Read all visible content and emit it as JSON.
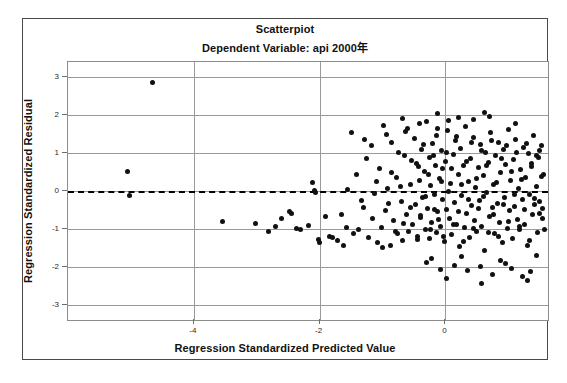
{
  "chart_data": {
    "type": "scatter",
    "title": "Scatterpiot",
    "subtitle": "Dependent Variable: api 2000年",
    "xlabel": "Regression Standardized Predicted Value",
    "ylabel": "Regression Standardized Residual",
    "xlim": [
      -6.0,
      1.63
    ],
    "ylim": [
      -3.38,
      3.38
    ],
    "xticks": [
      -4,
      -2,
      0
    ],
    "yticks": [
      3,
      2,
      1,
      0,
      -1,
      -2,
      -3
    ],
    "xtick_labels": [
      "-4",
      "-2",
      "0"
    ],
    "ytick_labels": [
      "3",
      "2",
      "1",
      "0",
      "-1",
      "-2",
      "-3"
    ],
    "grid": true,
    "legend": "none",
    "reference_line": {
      "axis": "y",
      "value": 0,
      "style": "dashed",
      "color": "#000000"
    },
    "marker": {
      "shape": "circle",
      "color": "#111111",
      "size": 5
    },
    "points": [
      [
        -4.65,
        2.85
      ],
      [
        -5.05,
        0.5
      ],
      [
        -5.03,
        -0.12
      ],
      [
        -3.55,
        -0.8
      ],
      [
        -3.02,
        -0.85
      ],
      [
        -2.82,
        -1.05
      ],
      [
        -2.6,
        -0.72
      ],
      [
        -2.48,
        -0.55
      ],
      [
        -2.44,
        -0.58
      ],
      [
        -2.18,
        -0.9
      ],
      [
        -2.12,
        0.22
      ],
      [
        -2.08,
        0.02
      ],
      [
        -2.06,
        -0.05
      ],
      [
        -2.02,
        -1.28
      ],
      [
        -2.0,
        -1.35
      ],
      [
        -1.9,
        -0.68
      ],
      [
        -1.85,
        -1.18
      ],
      [
        -1.8,
        -1.22
      ],
      [
        -1.72,
        -1.3
      ],
      [
        -1.66,
        -0.62
      ],
      [
        -1.58,
        -0.95
      ],
      [
        -1.5,
        1.52
      ],
      [
        -1.46,
        -1.12
      ],
      [
        -1.38,
        -1.02
      ],
      [
        -1.3,
        -0.42
      ],
      [
        -1.26,
        0.84
      ],
      [
        -1.22,
        -1.22
      ],
      [
        -1.18,
        1.18
      ],
      [
        -1.12,
        -0.06
      ],
      [
        -1.08,
        -1.36
      ],
      [
        -1.05,
        0.6
      ],
      [
        -1.02,
        -0.95
      ],
      [
        -0.98,
        1.72
      ],
      [
        -0.96,
        -0.52
      ],
      [
        -0.92,
        0.06
      ],
      [
        -0.88,
        -1.42
      ],
      [
        -0.85,
        1.28
      ],
      [
        -0.82,
        -0.78
      ],
      [
        -0.78,
        0.36
      ],
      [
        -0.76,
        -1.12
      ],
      [
        -0.74,
        1.02
      ],
      [
        -0.7,
        -0.28
      ],
      [
        -0.68,
        -1.3
      ],
      [
        -0.65,
        0.92
      ],
      [
        -0.62,
        -0.62
      ],
      [
        -0.6,
        1.64
      ],
      [
        -0.58,
        -1.05
      ],
      [
        -0.55,
        0.18
      ],
      [
        -0.52,
        -0.88
      ],
      [
        -0.5,
        1.38
      ],
      [
        -0.48,
        -0.35
      ],
      [
        -0.46,
        0.72
      ],
      [
        -0.44,
        -1.18
      ],
      [
        -0.42,
        0.28
      ],
      [
        -0.4,
        -0.7
      ],
      [
        -0.38,
        1.1
      ],
      [
        -0.36,
        -0.18
      ],
      [
        -0.34,
        0.52
      ],
      [
        -0.32,
        -1.02
      ],
      [
        -0.3,
        1.82
      ],
      [
        -0.28,
        -0.45
      ],
      [
        -0.26,
        0.88
      ],
      [
        -0.25,
        -1.25
      ],
      [
        -0.24,
        0.14
      ],
      [
        -0.22,
        -0.82
      ],
      [
        -0.2,
        1.25
      ],
      [
        -0.18,
        -0.08
      ],
      [
        -0.16,
        0.66
      ],
      [
        -0.15,
        -1.08
      ],
      [
        -0.14,
        1.45
      ],
      [
        -0.12,
        -0.55
      ],
      [
        -0.1,
        0.32
      ],
      [
        -0.08,
        -0.92
      ],
      [
        -0.06,
        1.05
      ],
      [
        -0.05,
        -0.22
      ],
      [
        -0.04,
        0.58
      ],
      [
        -0.02,
        -1.32
      ],
      [
        0.0,
        0.78
      ],
      [
        0.02,
        -0.48
      ],
      [
        0.04,
        1.58
      ],
      [
        0.06,
        -0.72
      ],
      [
        0.08,
        0.2
      ],
      [
        0.1,
        -1.15
      ],
      [
        0.12,
        0.96
      ],
      [
        0.14,
        -0.3
      ],
      [
        0.16,
        1.32
      ],
      [
        0.18,
        -0.88
      ],
      [
        0.2,
        0.44
      ],
      [
        0.22,
        -1.45
      ],
      [
        0.24,
        1.12
      ],
      [
        0.26,
        -0.12
      ],
      [
        0.28,
        0.68
      ],
      [
        0.3,
        -0.95
      ],
      [
        0.32,
        1.7
      ],
      [
        0.34,
        -0.58
      ],
      [
        0.36,
        0.24
      ],
      [
        0.38,
        -1.22
      ],
      [
        0.4,
        0.86
      ],
      [
        0.42,
        -0.38
      ],
      [
        0.44,
        1.4
      ],
      [
        0.46,
        -0.78
      ],
      [
        0.48,
        0.1
      ],
      [
        0.5,
        -1.05
      ],
      [
        0.52,
        0.62
      ],
      [
        0.54,
        -0.25
      ],
      [
        0.56,
        1.22
      ],
      [
        0.58,
        -0.92
      ],
      [
        0.6,
        0.4
      ],
      [
        0.62,
        -1.55
      ],
      [
        0.64,
        1.0
      ],
      [
        0.66,
        -0.05
      ],
      [
        0.68,
        0.74
      ],
      [
        0.7,
        -0.68
      ],
      [
        0.72,
        1.52
      ],
      [
        0.74,
        -0.42
      ],
      [
        0.76,
        0.16
      ],
      [
        0.78,
        -1.12
      ],
      [
        0.8,
        0.92
      ],
      [
        0.82,
        -0.32
      ],
      [
        0.84,
        1.28
      ],
      [
        0.86,
        -0.82
      ],
      [
        0.88,
        0.48
      ],
      [
        0.9,
        -1.35
      ],
      [
        0.92,
        1.08
      ],
      [
        0.94,
        -0.18
      ],
      [
        0.96,
        0.7
      ],
      [
        0.98,
        -0.98
      ],
      [
        1.0,
        1.62
      ],
      [
        1.02,
        -0.52
      ],
      [
        1.04,
        0.28
      ],
      [
        1.06,
        -1.25
      ],
      [
        1.08,
        0.82
      ],
      [
        1.1,
        -0.4
      ],
      [
        1.12,
        1.35
      ],
      [
        1.14,
        -0.75
      ],
      [
        1.16,
        0.06
      ],
      [
        1.18,
        -1.02
      ],
      [
        1.2,
        0.56
      ],
      [
        1.22,
        -0.22
      ],
      [
        1.24,
        1.15
      ],
      [
        1.26,
        -0.88
      ],
      [
        1.28,
        0.36
      ],
      [
        1.3,
        -1.42
      ],
      [
        1.32,
        0.98
      ],
      [
        1.34,
        -0.1
      ],
      [
        1.36,
        0.64
      ],
      [
        1.38,
        -0.62
      ],
      [
        1.4,
        1.45
      ],
      [
        1.42,
        -0.35
      ],
      [
        1.44,
        0.12
      ],
      [
        1.46,
        -1.08
      ],
      [
        1.48,
        0.88
      ],
      [
        1.5,
        -0.28
      ],
      [
        1.52,
        1.18
      ],
      [
        1.54,
        -0.72
      ],
      [
        1.56,
        0.42
      ],
      [
        -1.42,
        0.44
      ],
      [
        -1.34,
        -0.25
      ],
      [
        -1.28,
        1.35
      ],
      [
        -1.16,
        -0.72
      ],
      [
        -1.1,
        0.24
      ],
      [
        -1.0,
        -1.48
      ],
      [
        -0.94,
        1.48
      ],
      [
        -0.9,
        -0.32
      ],
      [
        -0.86,
        0.48
      ],
      [
        -0.8,
        -1.05
      ],
      [
        -0.72,
        0.12
      ],
      [
        -0.66,
        -0.85
      ],
      [
        -0.64,
        1.55
      ],
      [
        -0.56,
        -0.42
      ],
      [
        -0.54,
        0.8
      ],
      [
        -0.45,
        -1.28
      ],
      [
        -0.43,
        0.64
      ],
      [
        -0.39,
        -0.65
      ],
      [
        -0.35,
        1.22
      ],
      [
        -0.31,
        -0.15
      ],
      [
        -0.27,
        0.42
      ],
      [
        -0.23,
        -1.0
      ],
      [
        -0.19,
        0.94
      ],
      [
        -0.17,
        -0.48
      ],
      [
        -0.13,
        1.65
      ],
      [
        -0.11,
        -0.75
      ],
      [
        -0.07,
        0.26
      ],
      [
        -0.03,
        -1.18
      ],
      [
        0.01,
        1.02
      ],
      [
        0.05,
        -0.02
      ],
      [
        0.09,
        0.58
      ],
      [
        0.13,
        -0.88
      ],
      [
        0.17,
        1.42
      ],
      [
        0.21,
        -0.55
      ],
      [
        0.25,
        0.18
      ],
      [
        0.29,
        -1.32
      ],
      [
        0.33,
        0.78
      ],
      [
        0.37,
        -0.22
      ],
      [
        0.41,
        1.28
      ],
      [
        0.45,
        -0.98
      ],
      [
        0.49,
        0.34
      ],
      [
        0.53,
        -0.45
      ],
      [
        0.57,
        1.05
      ],
      [
        0.61,
        -0.15
      ],
      [
        0.65,
        0.66
      ],
      [
        0.69,
        -1.1
      ],
      [
        0.73,
        1.32
      ],
      [
        0.77,
        -0.62
      ],
      [
        0.81,
        0.22
      ],
      [
        0.85,
        -1.2
      ],
      [
        0.89,
        0.84
      ],
      [
        0.93,
        -0.36
      ],
      [
        0.97,
        1.18
      ],
      [
        1.01,
        -0.8
      ],
      [
        1.05,
        0.5
      ],
      [
        1.09,
        -0.08
      ],
      [
        1.13,
        1.0
      ],
      [
        1.17,
        -0.92
      ],
      [
        1.21,
        0.3
      ],
      [
        1.25,
        -0.48
      ],
      [
        1.29,
        1.25
      ],
      [
        1.33,
        -1.3
      ],
      [
        1.37,
        0.72
      ],
      [
        1.41,
        -0.2
      ],
      [
        1.45,
        0.94
      ],
      [
        1.49,
        -0.58
      ],
      [
        1.53,
        0.38
      ],
      [
        1.57,
        -1.0
      ],
      [
        0.15,
        -1.95
      ],
      [
        0.35,
        -2.08
      ],
      [
        0.55,
        -1.98
      ],
      [
        1.05,
        -2.02
      ],
      [
        -0.3,
        -1.88
      ],
      [
        0.75,
        -2.18
      ],
      [
        0.95,
        -1.9
      ],
      [
        1.35,
        -2.1
      ],
      [
        -0.08,
        -2.05
      ],
      [
        0.45,
        1.88
      ],
      [
        0.2,
        1.92
      ],
      [
        0.7,
        1.95
      ],
      [
        -0.42,
        1.76
      ],
      [
        1.12,
        1.78
      ],
      [
        0.05,
        1.84
      ],
      [
        1.3,
        -2.35
      ],
      [
        0.58,
        -2.42
      ],
      [
        -0.12,
        2.02
      ],
      [
        0.26,
        -1.72
      ],
      [
        0.88,
        -1.82
      ],
      [
        1.44,
        -1.68
      ],
      [
        -0.68,
        1.9
      ],
      [
        0.62,
        2.05
      ],
      [
        1.22,
        -2.25
      ],
      [
        0.02,
        -2.28
      ],
      [
        -0.22,
        -1.78
      ],
      [
        1.5,
        1.06
      ],
      [
        1.55,
        -0.46
      ],
      [
        -1.55,
        0.05
      ],
      [
        -1.62,
        -1.42
      ],
      [
        -2.3,
        -1.02
      ],
      [
        -2.36,
        -0.98
      ],
      [
        -2.7,
        -0.92
      ]
    ]
  }
}
